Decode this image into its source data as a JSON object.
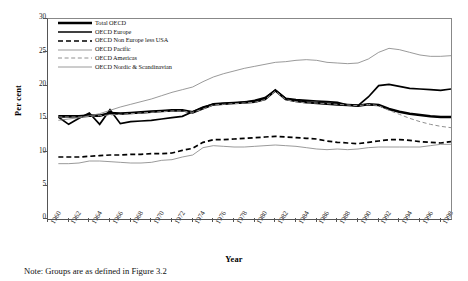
{
  "axes": {
    "y_label": "Per cent",
    "y_ticks": [
      0,
      5,
      10,
      15,
      20,
      25,
      30
    ],
    "x_label": "Year",
    "x_ticks": [
      1960,
      1962,
      1964,
      1966,
      1968,
      1970,
      1972,
      1974,
      1976,
      1978,
      1980,
      1982,
      1984,
      1986,
      1988,
      1990,
      1992,
      1994,
      1996,
      1998
    ]
  },
  "legend": [
    {
      "label": "Total OECD",
      "style": "solid",
      "width": 2.6,
      "color": "#000000"
    },
    {
      "label": "OECD Europe",
      "style": "solid",
      "width": 1.7,
      "color": "#000000"
    },
    {
      "label": "OECD Non Europe less USA",
      "style": "dashed",
      "width": 1.7,
      "color": "#000000"
    },
    {
      "label": "OECD Pacific",
      "style": "solid",
      "width": 0.8,
      "color": "#808080"
    },
    {
      "label": "OECD Americas",
      "style": "dashed",
      "width": 1.0,
      "color": "#909090"
    },
    {
      "label": "OECD Nordic & Scandinavian",
      "style": "solid",
      "width": 0.8,
      "color": "#808080"
    }
  ],
  "note": "Note: Groups are as defined in Figure 3.2",
  "chart_data": {
    "type": "line",
    "title": "",
    "xlabel": "Year",
    "ylabel": "Per cent",
    "xlim": [
      1960,
      1999
    ],
    "ylim": [
      0,
      30
    ],
    "grid": false,
    "legend_position": "top-left",
    "x": [
      1961,
      1962,
      1963,
      1964,
      1965,
      1966,
      1967,
      1968,
      1969,
      1970,
      1971,
      1972,
      1973,
      1974,
      1975,
      1976,
      1977,
      1978,
      1979,
      1980,
      1981,
      1982,
      1983,
      1984,
      1985,
      1986,
      1987,
      1988,
      1989,
      1990,
      1991,
      1992,
      1993,
      1994,
      1995,
      1996,
      1997,
      1998,
      1999
    ],
    "series": [
      {
        "name": "Total OECD",
        "style": "solid",
        "width": 2.6,
        "color": "#000000",
        "values": [
          15.4,
          15.4,
          15.4,
          15.5,
          15.5,
          15.9,
          15.8,
          15.9,
          16.0,
          16.1,
          16.2,
          16.3,
          16.3,
          16.0,
          16.6,
          17.2,
          17.3,
          17.4,
          17.5,
          17.6,
          18.0,
          19.3,
          18.0,
          17.7,
          17.5,
          17.4,
          17.3,
          17.2,
          17.1,
          17.0,
          17.2,
          17.1,
          16.5,
          16.1,
          15.8,
          15.6,
          15.4,
          15.3,
          15.3
        ]
      },
      {
        "name": "OECD Europe",
        "style": "solid",
        "width": 1.7,
        "color": "#000000",
        "values": [
          15.3,
          14.2,
          15.1,
          15.9,
          14.2,
          16.4,
          14.3,
          14.6,
          14.7,
          14.8,
          15.0,
          15.2,
          15.4,
          16.1,
          16.8,
          17.2,
          17.3,
          17.4,
          17.5,
          17.8,
          18.2,
          19.3,
          18.1,
          17.9,
          17.8,
          17.7,
          17.6,
          17.5,
          17.1,
          17.0,
          18.3,
          20.0,
          20.2,
          19.9,
          19.6,
          19.5,
          19.4,
          19.3,
          19.5
        ]
      },
      {
        "name": "OECD Non Europe less USA",
        "style": "dashed",
        "width": 1.7,
        "color": "#000000",
        "values": [
          9.3,
          9.3,
          9.3,
          9.4,
          9.5,
          9.6,
          9.6,
          9.7,
          9.7,
          9.8,
          9.8,
          9.9,
          10.3,
          10.6,
          11.5,
          11.9,
          11.9,
          12.0,
          12.1,
          12.2,
          12.3,
          12.4,
          12.3,
          12.2,
          12.1,
          12.0,
          11.7,
          11.5,
          11.4,
          11.3,
          11.5,
          11.7,
          11.9,
          11.9,
          11.8,
          11.6,
          11.5,
          11.4,
          11.6
        ]
      },
      {
        "name": "OECD Pacific",
        "style": "solid",
        "width": 0.8,
        "color": "#808080",
        "values": [
          8.3,
          8.3,
          8.4,
          8.7,
          8.7,
          8.6,
          8.5,
          8.4,
          8.4,
          8.5,
          8.8,
          8.9,
          9.3,
          9.6,
          10.7,
          11.0,
          10.9,
          10.8,
          10.8,
          10.9,
          11.0,
          11.1,
          11.0,
          10.9,
          10.7,
          10.5,
          10.4,
          10.5,
          10.4,
          10.5,
          10.7,
          10.8,
          10.8,
          10.8,
          10.8,
          10.8,
          11.0,
          11.2,
          11.2
        ]
      },
      {
        "name": "OECD Americas",
        "style": "dashed",
        "width": 1.0,
        "color": "#909090",
        "values": [
          15.3,
          15.3,
          15.3,
          15.4,
          15.5,
          15.6,
          15.7,
          15.8,
          15.9,
          16.0,
          16.1,
          16.2,
          16.2,
          16.0,
          16.5,
          17.1,
          17.2,
          17.3,
          17.4,
          17.5,
          17.9,
          19.2,
          17.9,
          17.6,
          17.4,
          17.4,
          17.3,
          17.2,
          17.1,
          17.0,
          17.2,
          17.0,
          16.3,
          15.7,
          15.1,
          14.6,
          14.2,
          13.9,
          13.7
        ]
      },
      {
        "name": "OECD Nordic & Scandinavian",
        "style": "solid",
        "width": 0.8,
        "color": "#808080",
        "values": [
          14.8,
          15.0,
          15.2,
          15.5,
          15.8,
          16.3,
          16.8,
          17.2,
          17.6,
          18.0,
          18.5,
          19.0,
          19.4,
          19.8,
          20.6,
          21.3,
          21.8,
          22.2,
          22.6,
          22.9,
          23.2,
          23.5,
          23.6,
          23.8,
          23.9,
          23.8,
          23.5,
          23.4,
          23.3,
          23.4,
          24.0,
          25.0,
          25.6,
          25.4,
          25.0,
          24.6,
          24.4,
          24.4,
          24.5
        ]
      }
    ]
  }
}
